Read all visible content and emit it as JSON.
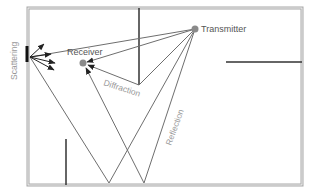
{
  "diagram": {
    "labels": {
      "transmitter": "Transmitter",
      "receiver": "Receiver",
      "diffraction": "Diffraction",
      "reflection": "Reflection",
      "scattering": "Scattering"
    },
    "nodes": [
      {
        "id": "transmitter",
        "label": "Transmitter"
      },
      {
        "id": "receiver",
        "label": "Receiver"
      }
    ],
    "mechanisms": [
      "Diffraction",
      "Reflection",
      "Scattering"
    ],
    "colors": {
      "frame": "#9a9a9a",
      "wall": "#333333",
      "ray": "#6e6e6e",
      "node": "#8a8a8a",
      "label_dark": "#555555",
      "label_light": "#999999"
    }
  }
}
